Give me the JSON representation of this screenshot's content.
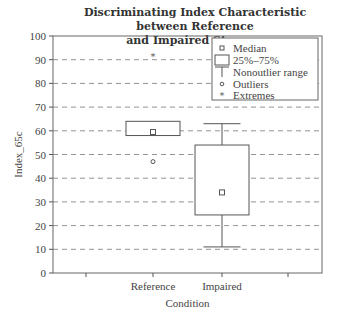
{
  "chart_data": {
    "type": "box",
    "title": "Discriminating Index Characteristic between Reference and Impaired Streams",
    "title_lines": [
      "Discriminating Index Characteristic between Reference",
      "and Impaired Streams"
    ],
    "xlabel": "Condition",
    "ylabel": "Index_65c",
    "ylim": [
      0,
      100
    ],
    "yticks": [
      0,
      10,
      20,
      30,
      40,
      50,
      60,
      70,
      80,
      90,
      100
    ],
    "grid": "horizontal dashed",
    "categories": [
      "Reference",
      "Impaired"
    ],
    "series": [
      {
        "name": "Reference",
        "median": 59.5,
        "q1": 58,
        "q3": 64,
        "whisker_low": 58,
        "whisker_high": 64,
        "outliers": [
          47
        ],
        "extremes": [
          91.5
        ]
      },
      {
        "name": "Impaired",
        "median": 34,
        "q1": 24.5,
        "q3": 54,
        "whisker_low": 11,
        "whisker_high": 63,
        "outliers": [],
        "extremes": []
      }
    ],
    "legend": {
      "position": "upper right",
      "entries": [
        "Median",
        "25%–75%",
        "Nonoutlier range",
        "Outliers",
        "Extremes"
      ]
    }
  }
}
